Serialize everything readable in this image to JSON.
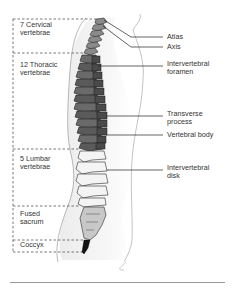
{
  "diagram": {
    "regions": [
      {
        "id": "cervical",
        "label": "7 Cervical\nvertebrae",
        "top": 19,
        "bottom": 53
      },
      {
        "id": "thoracic",
        "label": "12 Thoracic\nvertebrae",
        "top": 53,
        "bottom": 149
      },
      {
        "id": "lumbar",
        "label": "5 Lumbar\nvertebrae",
        "top": 149,
        "bottom": 206
      },
      {
        "id": "sacrum",
        "label": "Fused\nsacrum",
        "top": 206,
        "bottom": 240
      },
      {
        "id": "coccyx",
        "label": "Coccyx",
        "top": 240,
        "bottom": 252
      }
    ],
    "callouts": [
      {
        "id": "atlas",
        "label": "Atlas",
        "y": 37
      },
      {
        "id": "axis",
        "label": "Axis",
        "y": 47
      },
      {
        "id": "intervertebral-foramen",
        "label": "Intervertebral\nforamen",
        "y": 66
      },
      {
        "id": "transverse-process",
        "label": "Transverse\nprocess",
        "y": 116
      },
      {
        "id": "vertebral-body",
        "label": "Vertebral body",
        "y": 135
      },
      {
        "id": "intervertebral-disk",
        "label": "Intervertebral\ndisk",
        "y": 170
      }
    ],
    "colors": {
      "thoracic_fill": "#5e5e5e",
      "cervical_fill": "#8a8a8a",
      "lumbar_fill": "#f2f2f2",
      "sacrum_fill": "#c8c8c8",
      "coccyx_fill": "#111111",
      "outline": "#2a2a2a",
      "body_silhouette": "#e6e6e6",
      "dashed_line": "#555555",
      "leader_line": "#222222",
      "rule": "#9a9a9a"
    }
  }
}
